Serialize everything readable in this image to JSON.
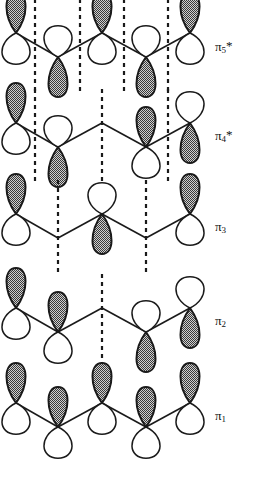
{
  "figure": {
    "type": "molecular-orbital-diagram",
    "width": 262,
    "height": 478,
    "background_color": "#ffffff",
    "stroke_color": "#1a1a1a",
    "lobe_fill_shaded": "#8c8c8c",
    "lobe_fill_empty": "#ffffff"
  },
  "geometry": {
    "atom_x": [
      16,
      58,
      102,
      146,
      190
    ],
    "zigzag_up_offset": -12,
    "zigzag_down_offset": 12,
    "row_center_y": [
      45,
      135,
      226,
      320,
      415
    ],
    "node_line_x": [
      35,
      80,
      124,
      168
    ],
    "lobe_width": 26,
    "lobe_height": 40
  },
  "rows": [
    {
      "id": "pi5star",
      "label": "π",
      "label_sub": "5",
      "label_star": "*",
      "label_x": 215,
      "label_y": 38,
      "nodes": 4,
      "node_x": [
        35,
        80,
        124,
        168
      ],
      "orbitals": [
        {
          "atom": 1,
          "position": "up",
          "top_lobe": "shaded",
          "bottom_lobe": "empty",
          "present": true
        },
        {
          "atom": 2,
          "position": "down",
          "top_lobe": "empty",
          "bottom_lobe": "shaded",
          "present": true
        },
        {
          "atom": 3,
          "position": "up",
          "top_lobe": "shaded",
          "bottom_lobe": "empty",
          "present": true
        },
        {
          "atom": 4,
          "position": "down",
          "top_lobe": "empty",
          "bottom_lobe": "shaded",
          "present": true
        },
        {
          "atom": 5,
          "position": "up",
          "top_lobe": "shaded",
          "bottom_lobe": "empty",
          "present": true
        }
      ]
    },
    {
      "id": "pi4star",
      "label": "π",
      "label_sub": "4",
      "label_star": "*",
      "label_x": 215,
      "label_y": 127,
      "nodes": 3,
      "node_x": [
        35,
        102,
        168
      ],
      "orbitals": [
        {
          "atom": 1,
          "position": "up",
          "top_lobe": "shaded",
          "bottom_lobe": "empty",
          "present": true
        },
        {
          "atom": 2,
          "position": "down",
          "top_lobe": "empty",
          "bottom_lobe": "shaded",
          "present": true
        },
        {
          "atom": 3,
          "position": "up",
          "top_lobe": "none",
          "bottom_lobe": "none",
          "present": false
        },
        {
          "atom": 4,
          "position": "down",
          "top_lobe": "shaded",
          "bottom_lobe": "empty",
          "present": true
        },
        {
          "atom": 5,
          "position": "up",
          "top_lobe": "empty",
          "bottom_lobe": "shaded",
          "present": true
        }
      ]
    },
    {
      "id": "pi3",
      "label": "π",
      "label_sub": "3",
      "label_star": "",
      "label_x": 215,
      "label_y": 219,
      "nodes": 2,
      "node_x": [
        58,
        146
      ],
      "orbitals": [
        {
          "atom": 1,
          "position": "up",
          "top_lobe": "shaded",
          "bottom_lobe": "empty",
          "present": true
        },
        {
          "atom": 2,
          "position": "down",
          "top_lobe": "none",
          "bottom_lobe": "none",
          "present": false
        },
        {
          "atom": 3,
          "position": "up",
          "top_lobe": "empty",
          "bottom_lobe": "shaded",
          "present": true
        },
        {
          "atom": 4,
          "position": "down",
          "top_lobe": "none",
          "bottom_lobe": "none",
          "present": false
        },
        {
          "atom": 5,
          "position": "up",
          "top_lobe": "shaded",
          "bottom_lobe": "empty",
          "present": true
        }
      ]
    },
    {
      "id": "pi2",
      "label": "π",
      "label_sub": "2",
      "label_star": "",
      "label_x": 215,
      "label_y": 313,
      "nodes": 1,
      "node_x": [
        102
      ],
      "orbitals": [
        {
          "atom": 1,
          "position": "up",
          "top_lobe": "shaded",
          "bottom_lobe": "empty",
          "present": true
        },
        {
          "atom": 2,
          "position": "down",
          "top_lobe": "shaded",
          "bottom_lobe": "empty",
          "present": true
        },
        {
          "atom": 3,
          "position": "up",
          "top_lobe": "none",
          "bottom_lobe": "none",
          "present": false
        },
        {
          "atom": 4,
          "position": "down",
          "top_lobe": "empty",
          "bottom_lobe": "shaded",
          "present": true
        },
        {
          "atom": 5,
          "position": "up",
          "top_lobe": "empty",
          "bottom_lobe": "shaded",
          "present": true
        }
      ]
    },
    {
      "id": "pi1",
      "label": "π",
      "label_sub": "1",
      "label_star": "",
      "label_x": 215,
      "label_y": 408,
      "nodes": 0,
      "node_x": [],
      "orbitals": [
        {
          "atom": 1,
          "position": "up",
          "top_lobe": "shaded",
          "bottom_lobe": "empty",
          "present": true
        },
        {
          "atom": 2,
          "position": "down",
          "top_lobe": "shaded",
          "bottom_lobe": "empty",
          "present": true
        },
        {
          "atom": 3,
          "position": "up",
          "top_lobe": "shaded",
          "bottom_lobe": "empty",
          "present": true
        },
        {
          "atom": 4,
          "position": "down",
          "top_lobe": "shaded",
          "bottom_lobe": "empty",
          "present": true
        },
        {
          "atom": 5,
          "position": "up",
          "top_lobe": "shaded",
          "bottom_lobe": "empty",
          "present": true
        }
      ]
    }
  ]
}
